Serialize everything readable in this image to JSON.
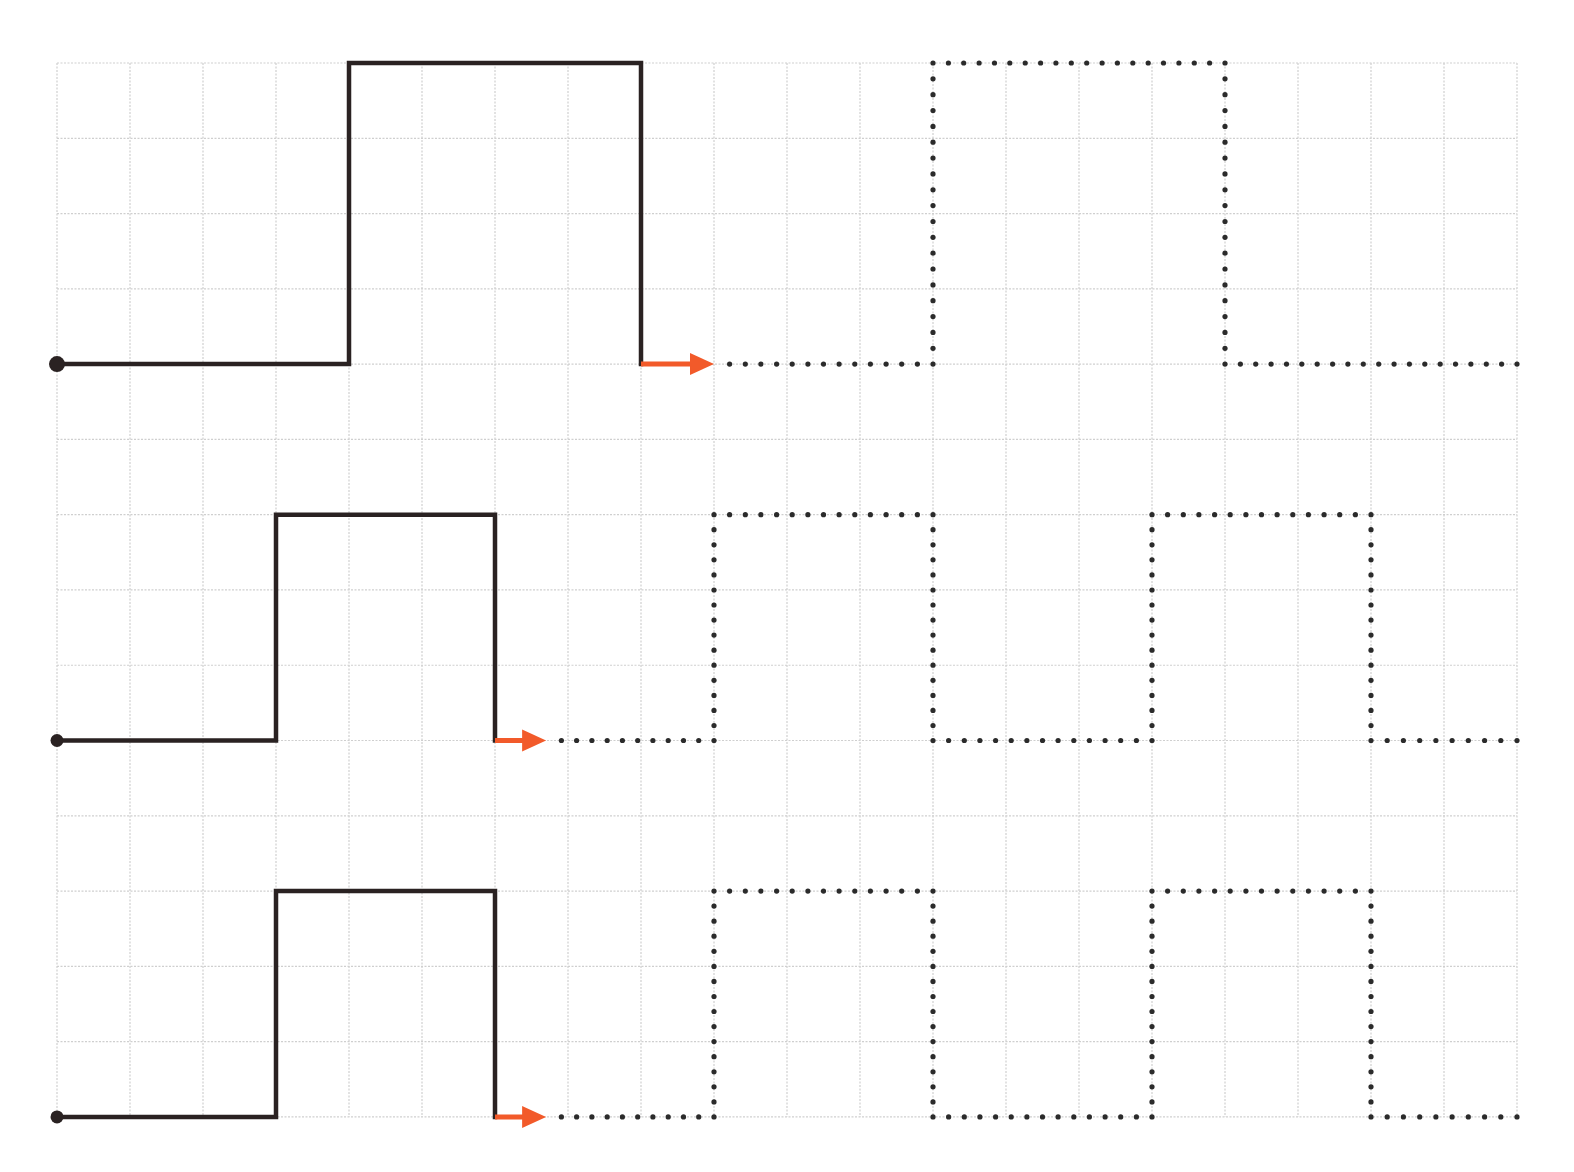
{
  "worksheet": {
    "type": "tracing-worksheet",
    "description": "Trace the square-wave patterns following the arrows",
    "grid": {
      "origin_x": 57,
      "origin_y": 63,
      "cell_w": 73,
      "cell_h": 75.28,
      "cols": 20,
      "rows": 14,
      "line_color": "#cfcfcf"
    },
    "colors": {
      "path": "#2a2222",
      "arrow": "#f25a2a",
      "dots": "#2b2b2b"
    },
    "dot_spacing": 15.5,
    "patterns": [
      {
        "name": "pattern-1-large",
        "start_dot_radius": 8,
        "solid": [
          [
            0,
            4
          ],
          [
            4,
            4
          ],
          [
            4,
            0
          ],
          [
            8,
            0
          ],
          [
            8,
            4
          ]
        ],
        "arrow": {
          "from": [
            8,
            4
          ],
          "to": [
            9,
            4
          ]
        },
        "dotted": [
          [
            9,
            4
          ],
          [
            12,
            4
          ],
          [
            12,
            0
          ],
          [
            16,
            0
          ],
          [
            16,
            4
          ],
          [
            20,
            4
          ]
        ]
      },
      {
        "name": "pattern-2-medium",
        "start_dot_radius": 6.5,
        "solid": [
          [
            0,
            9
          ],
          [
            3,
            9
          ],
          [
            3,
            6
          ],
          [
            6,
            6
          ],
          [
            6,
            9
          ]
        ],
        "arrow": {
          "from": [
            6,
            9
          ],
          "to": [
            6.7,
            9
          ]
        },
        "dotted": [
          [
            6.7,
            9
          ],
          [
            9,
            9
          ],
          [
            9,
            6
          ],
          [
            12,
            6
          ],
          [
            12,
            9
          ],
          [
            15,
            9
          ],
          [
            15,
            6
          ],
          [
            18,
            6
          ],
          [
            18,
            9
          ],
          [
            20,
            9
          ]
        ]
      },
      {
        "name": "pattern-3-medium",
        "start_dot_radius": 6.5,
        "solid": [
          [
            0,
            14
          ],
          [
            3,
            14
          ],
          [
            3,
            11
          ],
          [
            6,
            11
          ],
          [
            6,
            14
          ]
        ],
        "arrow": {
          "from": [
            6,
            14
          ],
          "to": [
            6.7,
            14
          ]
        },
        "dotted": [
          [
            6.7,
            14
          ],
          [
            9,
            14
          ],
          [
            9,
            11
          ],
          [
            12,
            11
          ],
          [
            12,
            14
          ],
          [
            15,
            14
          ],
          [
            15,
            11
          ],
          [
            18,
            11
          ],
          [
            18,
            14
          ],
          [
            20,
            14
          ]
        ]
      }
    ]
  }
}
